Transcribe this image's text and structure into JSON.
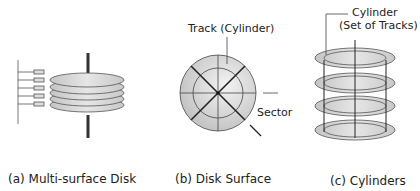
{
  "figure": {
    "panels": [
      {
        "id": "a",
        "caption": "(a) Multi-surface Disk",
        "platter_count": 5
      },
      {
        "id": "b",
        "caption": "(b) Disk Surface",
        "labels": {
          "track": "Track (Cylinder)",
          "sector": "Sector"
        }
      },
      {
        "id": "c",
        "caption": "(c) Cylinders",
        "platter_count": 4,
        "labels": {
          "cylinder_line1": "Cylinder",
          "cylinder_line2": "(Set of Tracks)"
        }
      }
    ],
    "colors": {
      "platter_fill": "#d4d4d4",
      "platter_light": "#ececec",
      "stroke": "#222222",
      "spindle": "#333333"
    }
  }
}
